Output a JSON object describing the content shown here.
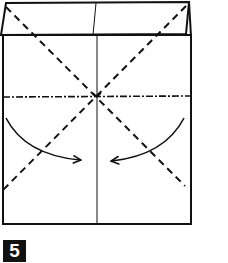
{
  "diagram": {
    "type": "origami-fold-instruction",
    "step_number": "5",
    "colors": {
      "line": "#111111",
      "background": "#ffffff",
      "badge_bg": "#111111",
      "badge_text": "#ffffff"
    },
    "elements": [
      "top-flap",
      "paper-rectangle",
      "center-vertical-crease",
      "mountain-fold-horizontal-line",
      "valley-fold-diagonal-left",
      "valley-fold-diagonal-right",
      "fold-arrow-left",
      "fold-arrow-right"
    ]
  }
}
